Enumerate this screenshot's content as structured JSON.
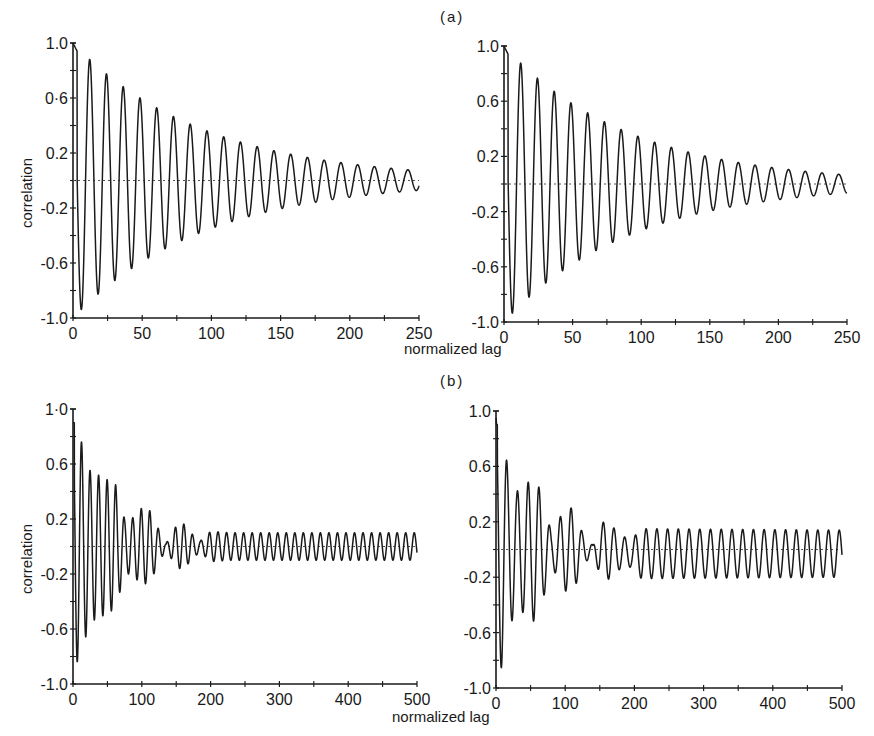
{
  "figure": {
    "panel_a_label": "(a)",
    "panel_b_label": "(b)",
    "xlabel": "normalized lag",
    "ylabel": "correlation"
  },
  "chart_data": [
    {
      "id": "a-left",
      "type": "line",
      "title": "(a)",
      "xlabel": "normalized lag",
      "ylabel": "correlation",
      "xlim": [
        0,
        250
      ],
      "ylim": [
        -1.0,
        1.0
      ],
      "xticks": [
        0,
        50,
        100,
        150,
        200,
        250
      ],
      "xtick_labels": [
        "0",
        "50",
        "100",
        "150",
        "200",
        "250"
      ],
      "yticks": [
        1.0,
        0.6,
        0.2,
        -0.2,
        -0.6,
        -1.0
      ],
      "ytick_labels": [
        "1.0",
        "0·6",
        "0.2",
        "-0.2",
        "-0.6",
        "-1.0"
      ],
      "zero_line": "dotted",
      "grid": false,
      "description": "Damped cosine autocorrelation, period ~12 lag units, decaying from 1.0 at lag 0 to ~±0.03 at lag 250",
      "series": [
        {
          "name": "correlation",
          "model": "damped_cosine",
          "period": 12.1,
          "decay_tau": 95,
          "peaks": [
            {
              "x": 0,
              "y": 1.0
            },
            {
              "x": 12,
              "y": 0.82
            },
            {
              "x": 24,
              "y": 0.69
            },
            {
              "x": 36,
              "y": 0.57
            },
            {
              "x": 48,
              "y": 0.47
            },
            {
              "x": 60,
              "y": 0.39
            },
            {
              "x": 73,
              "y": 0.32
            },
            {
              "x": 85,
              "y": 0.27
            },
            {
              "x": 97,
              "y": 0.22
            },
            {
              "x": 109,
              "y": 0.18
            },
            {
              "x": 121,
              "y": 0.15
            },
            {
              "x": 133,
              "y": 0.12
            },
            {
              "x": 145,
              "y": 0.1
            },
            {
              "x": 157,
              "y": 0.08
            },
            {
              "x": 170,
              "y": 0.07
            },
            {
              "x": 182,
              "y": 0.06
            },
            {
              "x": 194,
              "y": 0.05
            },
            {
              "x": 206,
              "y": 0.04
            },
            {
              "x": 218,
              "y": 0.03
            },
            {
              "x": 230,
              "y": 0.03
            },
            {
              "x": 242,
              "y": 0.02
            }
          ],
          "troughs": [
            {
              "x": 6,
              "y": -0.88
            },
            {
              "x": 18,
              "y": -0.75
            },
            {
              "x": 30,
              "y": -0.63
            },
            {
              "x": 42,
              "y": -0.52
            },
            {
              "x": 54,
              "y": -0.43
            },
            {
              "x": 66,
              "y": -0.36
            },
            {
              "x": 79,
              "y": -0.3
            },
            {
              "x": 91,
              "y": -0.25
            },
            {
              "x": 103,
              "y": -0.21
            },
            {
              "x": 115,
              "y": -0.17
            },
            {
              "x": 127,
              "y": -0.14
            },
            {
              "x": 139,
              "y": -0.12
            },
            {
              "x": 151,
              "y": -0.1
            },
            {
              "x": 163,
              "y": -0.08
            },
            {
              "x": 176,
              "y": -0.07
            },
            {
              "x": 188,
              "y": -0.06
            },
            {
              "x": 200,
              "y": -0.05
            },
            {
              "x": 212,
              "y": -0.04
            },
            {
              "x": 224,
              "y": -0.03
            },
            {
              "x": 236,
              "y": -0.03
            },
            {
              "x": 248,
              "y": -0.02
            }
          ]
        }
      ]
    },
    {
      "id": "a-right",
      "type": "line",
      "title": "(a)",
      "xlabel": "normalized lag",
      "ylabel": "",
      "xlim": [
        0,
        250
      ],
      "ylim": [
        -1.0,
        1.0
      ],
      "xticks": [
        0,
        50,
        100,
        150,
        200,
        250
      ],
      "xtick_labels": [
        "0",
        "50",
        "100",
        "150",
        "200",
        "250"
      ],
      "yticks": [
        1.0,
        0.6,
        0.2,
        -0.2,
        -0.6,
        -1.0
      ],
      "ytick_labels": [
        "1.0",
        "0.6",
        "0.2",
        "-0.2",
        "-0.6",
        "-1.0"
      ],
      "zero_line": "dotted",
      "grid": false,
      "description": "Damped cosine autocorrelation nearly identical to left panel, slightly lower-offset tail",
      "series": [
        {
          "name": "correlation",
          "model": "damped_cosine",
          "period": 12.2,
          "decay_tau": 92,
          "peaks": [
            {
              "x": 0,
              "y": 1.0
            },
            {
              "x": 12,
              "y": 0.81
            },
            {
              "x": 24,
              "y": 0.68
            },
            {
              "x": 36,
              "y": 0.56
            },
            {
              "x": 49,
              "y": 0.45
            },
            {
              "x": 61,
              "y": 0.38
            },
            {
              "x": 73,
              "y": 0.31
            },
            {
              "x": 85,
              "y": 0.27
            },
            {
              "x": 98,
              "y": 0.21
            },
            {
              "x": 110,
              "y": 0.17
            },
            {
              "x": 122,
              "y": 0.14
            },
            {
              "x": 134,
              "y": 0.12
            },
            {
              "x": 146,
              "y": 0.09
            },
            {
              "x": 159,
              "y": 0.08
            },
            {
              "x": 171,
              "y": 0.06
            },
            {
              "x": 183,
              "y": 0.05
            },
            {
              "x": 195,
              "y": 0.04
            },
            {
              "x": 207,
              "y": 0.03
            },
            {
              "x": 220,
              "y": 0.03
            },
            {
              "x": 232,
              "y": 0.02
            },
            {
              "x": 244,
              "y": 0.02
            }
          ],
          "troughs": [
            {
              "x": 6,
              "y": -0.9
            },
            {
              "x": 18,
              "y": -0.76
            },
            {
              "x": 30,
              "y": -0.62
            },
            {
              "x": 43,
              "y": -0.52
            },
            {
              "x": 55,
              "y": -0.43
            },
            {
              "x": 67,
              "y": -0.36
            },
            {
              "x": 79,
              "y": -0.31
            },
            {
              "x": 91,
              "y": -0.25
            },
            {
              "x": 104,
              "y": -0.22
            },
            {
              "x": 116,
              "y": -0.18
            },
            {
              "x": 128,
              "y": -0.15
            },
            {
              "x": 140,
              "y": -0.12
            },
            {
              "x": 152,
              "y": -0.11
            },
            {
              "x": 165,
              "y": -0.09
            },
            {
              "x": 177,
              "y": -0.08
            },
            {
              "x": 189,
              "y": -0.07
            },
            {
              "x": 201,
              "y": -0.06
            },
            {
              "x": 213,
              "y": -0.05
            },
            {
              "x": 226,
              "y": -0.05
            },
            {
              "x": 238,
              "y": -0.04
            },
            {
              "x": 250,
              "y": -0.03
            }
          ]
        }
      ]
    },
    {
      "id": "b-left",
      "type": "line",
      "title": "(b)",
      "xlabel": "normalized lag",
      "ylabel": "correlation",
      "xlim": [
        0,
        500
      ],
      "ylim": [
        -1.0,
        1.0
      ],
      "xticks": [
        0,
        100,
        200,
        300,
        400,
        500
      ],
      "xtick_labels": [
        "0",
        "100",
        "200",
        "300",
        "400",
        "500"
      ],
      "yticks": [
        1.0,
        0.6,
        0.2,
        -0.2,
        -0.6,
        -1.0
      ],
      "ytick_labels": [
        "1·0",
        "0.6",
        "0.2",
        "-0.2",
        "-0.6",
        "-1.0"
      ],
      "zero_line": "dotted",
      "grid": false,
      "description": "Beating autocorrelation: large decaying oscillation (period ~12.5) to lag ~130, irregular transition, then steady oscillation amplitude ~0.1 to lag 500",
      "series": [
        {
          "name": "correlation",
          "model": "beat_then_steady",
          "period": 12.4,
          "envelope": [
            {
              "x": 0,
              "amp": 0.9
            },
            {
              "x": 10,
              "amp": 0.8
            },
            {
              "x": 25,
              "amp": 0.55
            },
            {
              "x": 45,
              "amp": 0.5
            },
            {
              "x": 62,
              "amp": 0.45
            },
            {
              "x": 75,
              "amp": 0.2
            },
            {
              "x": 85,
              "amp": 0.2
            },
            {
              "x": 100,
              "amp": 0.28
            },
            {
              "x": 112,
              "amp": 0.26
            },
            {
              "x": 125,
              "amp": 0.12
            },
            {
              "x": 135,
              "amp": 0.02
            },
            {
              "x": 150,
              "amp": 0.15
            },
            {
              "x": 160,
              "amp": 0.17
            },
            {
              "x": 175,
              "amp": 0.08
            },
            {
              "x": 185,
              "amp": 0.04
            },
            {
              "x": 200,
              "amp": 0.11
            },
            {
              "x": 230,
              "amp": 0.1
            },
            {
              "x": 500,
              "amp": 0.1
            }
          ],
          "key_extrema": [
            {
              "x": 0,
              "y": 0.76
            },
            {
              "x": 6,
              "y": -0.88
            },
            {
              "x": 12,
              "y": 0.72
            },
            {
              "x": 18,
              "y": -0.61
            },
            {
              "x": 25,
              "y": 0.5
            },
            {
              "x": 31,
              "y": -0.47
            },
            {
              "x": 37,
              "y": 0.48
            },
            {
              "x": 43,
              "y": -0.51
            },
            {
              "x": 49,
              "y": 0.52
            },
            {
              "x": 56,
              "y": -0.5
            },
            {
              "x": 62,
              "y": 0.42
            },
            {
              "x": 68,
              "y": -0.32
            },
            {
              "x": 74,
              "y": 0.21
            },
            {
              "x": 80,
              "y": -0.16
            },
            {
              "x": 86,
              "y": 0.17
            },
            {
              "x": 92,
              "y": -0.23
            },
            {
              "x": 98,
              "y": 0.27
            },
            {
              "x": 104,
              "y": -0.29
            },
            {
              "x": 110,
              "y": 0.27
            },
            {
              "x": 116,
              "y": -0.21
            },
            {
              "x": 122,
              "y": 0.12
            },
            {
              "x": 160,
              "y": 0.18
            },
            {
              "x": 167,
              "y": -0.17
            },
            {
              "x": 205,
              "y": 0.13
            },
            {
              "x": 300,
              "y": 0.11
            },
            {
              "x": 400,
              "y": 0.1
            },
            {
              "x": 490,
              "y": 0.09
            }
          ]
        }
      ]
    },
    {
      "id": "b-right",
      "type": "line",
      "title": "(b)",
      "xlabel": "normalized lag",
      "ylabel": "",
      "xlim": [
        0,
        500
      ],
      "ylim": [
        -1.0,
        1.0
      ],
      "xticks": [
        0,
        100,
        200,
        300,
        400,
        500
      ],
      "xtick_labels": [
        "0",
        "100",
        "200",
        "300",
        "400",
        "500"
      ],
      "yticks": [
        1.0,
        0.6,
        0.2,
        -0.2,
        -0.6,
        -1.0
      ],
      "ytick_labels": [
        "1.0",
        "0.6",
        "0.2",
        "-0.2",
        "-0.6",
        "-1.0"
      ],
      "zero_line": "dotted",
      "grid": false,
      "description": "Beating autocorrelation similar to left, steady tail amplitude ~0.15 offset slightly below zero",
      "series": [
        {
          "name": "correlation",
          "model": "beat_then_steady",
          "period": 15.5,
          "envelope": [
            {
              "x": 0,
              "amp": 0.95
            },
            {
              "x": 8,
              "amp": 0.85
            },
            {
              "x": 17,
              "amp": 0.6
            },
            {
              "x": 30,
              "amp": 0.42
            },
            {
              "x": 45,
              "amp": 0.48
            },
            {
              "x": 55,
              "amp": 0.52
            },
            {
              "x": 65,
              "amp": 0.42
            },
            {
              "x": 80,
              "amp": 0.12
            },
            {
              "x": 100,
              "amp": 0.3
            },
            {
              "x": 112,
              "amp": 0.3
            },
            {
              "x": 125,
              "amp": 0.12
            },
            {
              "x": 140,
              "amp": 0.03
            },
            {
              "x": 150,
              "amp": 0.18
            },
            {
              "x": 160,
              "amp": 0.22
            },
            {
              "x": 180,
              "amp": 0.12
            },
            {
              "x": 195,
              "amp": 0.1
            },
            {
              "x": 210,
              "amp": 0.18
            },
            {
              "x": 500,
              "amp": 0.17
            }
          ],
          "key_extrema": [
            {
              "x": 0,
              "y": 0.95
            },
            {
              "x": 8,
              "y": -0.88
            },
            {
              "x": 17,
              "y": 0.69
            },
            {
              "x": 22,
              "y": -0.55
            },
            {
              "x": 28,
              "y": 0.39
            },
            {
              "x": 33,
              "y": -0.4
            },
            {
              "x": 39,
              "y": 0.41
            },
            {
              "x": 45,
              "y": -0.51
            },
            {
              "x": 52,
              "y": 0.53
            },
            {
              "x": 57,
              "y": -0.53
            },
            {
              "x": 65,
              "y": 0.46
            },
            {
              "x": 70,
              "y": -0.31
            },
            {
              "x": 100,
              "y": 0.28
            },
            {
              "x": 107,
              "y": -0.35
            },
            {
              "x": 113,
              "y": 0.3
            },
            {
              "x": 160,
              "y": 0.22
            },
            {
              "x": 210,
              "y": 0.17
            },
            {
              "x": 300,
              "y": 0.16
            },
            {
              "x": 400,
              "y": 0.16
            },
            {
              "x": 490,
              "y": 0.15
            },
            {
              "x": 495,
              "y": -0.2
            }
          ],
          "tail_offset": -0.03
        }
      ]
    }
  ],
  "layout": {
    "panels": [
      {
        "id": "a-left",
        "x0": 73,
        "x1": 419,
        "ytop": 43,
        "ybot": 318
      },
      {
        "id": "a-right",
        "x0": 504,
        "x1": 847,
        "ytop": 46,
        "ybot": 322
      },
      {
        "id": "b-left",
        "x0": 73,
        "x1": 417,
        "ytop": 409,
        "ybot": 684
      },
      {
        "id": "b-right",
        "x0": 496,
        "x1": 842,
        "ytop": 411,
        "ybot": 688
      }
    ],
    "line_color": "#1a1a1a",
    "zero_line_color": "#555555"
  }
}
